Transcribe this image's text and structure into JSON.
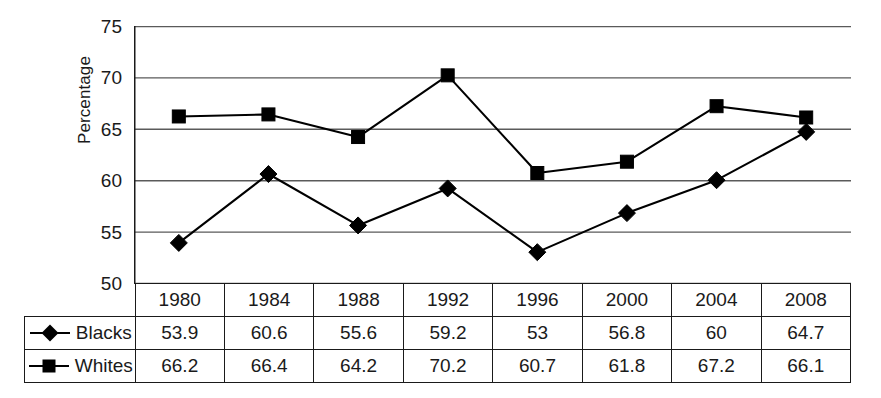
{
  "chart_data": {
    "type": "line",
    "title": "",
    "xlabel": "",
    "ylabel": "Percentage",
    "categories": [
      "1980",
      "1984",
      "1988",
      "1992",
      "1996",
      "2000",
      "2004",
      "2008"
    ],
    "ylim": [
      50,
      75
    ],
    "yticks": [
      "50",
      "55",
      "60",
      "65",
      "70",
      "75"
    ],
    "grid": "horizontal",
    "legend_position": "table-left",
    "series": [
      {
        "name": "Blacks",
        "marker": "diamond",
        "color": "#000000",
        "values": [
          53.9,
          60.6,
          55.6,
          59.2,
          53,
          56.8,
          60,
          64.7
        ],
        "labels": [
          "53.9",
          "60.6",
          "55.6",
          "59.2",
          "53",
          "56.8",
          "60",
          "64.7"
        ]
      },
      {
        "name": "Whites",
        "marker": "square",
        "color": "#000000",
        "values": [
          66.2,
          66.4,
          64.2,
          70.2,
          60.7,
          61.8,
          67.2,
          66.1
        ],
        "labels": [
          "66.2",
          "66.4",
          "64.2",
          "70.2",
          "60.7",
          "61.8",
          "67.2",
          "66.1"
        ]
      }
    ]
  },
  "axis": {
    "y_title": "Percentage",
    "y_tick_75": "75",
    "y_tick_70": "70",
    "y_tick_65": "65",
    "y_tick_60": "60",
    "y_tick_55": "55",
    "y_tick_50": "50"
  },
  "table": {
    "years": [
      "1980",
      "1984",
      "1988",
      "1992",
      "1996",
      "2000",
      "2004",
      "2008"
    ],
    "rows": [
      {
        "label": "Blacks",
        "marker": "diamond",
        "values": [
          "53.9",
          "60.6",
          "55.6",
          "59.2",
          "53",
          "56.8",
          "60",
          "64.7"
        ]
      },
      {
        "label": "Whites",
        "marker": "square",
        "values": [
          "66.2",
          "66.4",
          "64.2",
          "70.2",
          "60.7",
          "61.8",
          "67.2",
          "66.1"
        ]
      }
    ]
  },
  "colors": {
    "line": "#000000",
    "grid": "#5a5a5a",
    "axis": "#1a1a1a",
    "background": "#ffffff",
    "text": "#1a1a1a"
  }
}
